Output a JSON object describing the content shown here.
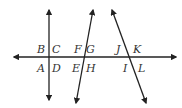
{
  "diagram": {
    "line_color": "#222222",
    "lines": [
      {
        "id": "horizontal",
        "x1": 14,
        "y1": 57,
        "x2": 176,
        "y2": 57
      },
      {
        "id": "vertical",
        "x1": 49,
        "y1": 10,
        "x2": 49,
        "y2": 100
      },
      {
        "id": "transversal-1",
        "x1": 93,
        "y1": 10,
        "x2": 76,
        "y2": 103
      },
      {
        "id": "transversal-2",
        "x1": 112,
        "y1": 10,
        "x2": 146,
        "y2": 103
      }
    ],
    "labels": [
      {
        "text": "B",
        "x": 37,
        "y": 53
      },
      {
        "text": "C",
        "x": 52,
        "y": 53
      },
      {
        "text": "A",
        "x": 37,
        "y": 72
      },
      {
        "text": "D",
        "x": 52,
        "y": 72
      },
      {
        "text": "F",
        "x": 74,
        "y": 53
      },
      {
        "text": "G",
        "x": 86,
        "y": 53
      },
      {
        "text": "E",
        "x": 72,
        "y": 72
      },
      {
        "text": "H",
        "x": 86,
        "y": 72
      },
      {
        "text": "J",
        "x": 116,
        "y": 53
      },
      {
        "text": "K",
        "x": 133,
        "y": 53
      },
      {
        "text": "I",
        "x": 123,
        "y": 72
      },
      {
        "text": "L",
        "x": 138,
        "y": 72
      }
    ]
  }
}
